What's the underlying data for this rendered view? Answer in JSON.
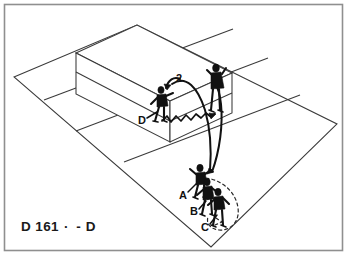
{
  "diagram": {
    "title": "D 161",
    "caption": {
      "code": "D 161",
      "separator": "· -",
      "tail": "D"
    },
    "kind": "volleyball-court-perspective-drill",
    "background_color": "#ffffff",
    "ink_color": "#111111",
    "frame_color": "#8f8f8f",
    "court_line_color": "#3a3a3a"
  },
  "labels": {
    "player_a": "A",
    "player_b": "B",
    "player_c": "C",
    "player_d": "D",
    "sequence_2": "2"
  },
  "players": [
    {
      "id": "player-a",
      "label": "A",
      "role": "setter-front",
      "x": 200,
      "y": 174
    },
    {
      "id": "player-b",
      "label": "B",
      "role": "receiver-middle",
      "x": 203,
      "y": 192
    },
    {
      "id": "player-c",
      "label": "C",
      "role": "receiver-back",
      "x": 215,
      "y": 204
    },
    {
      "id": "player-d",
      "label": "D",
      "role": "opponent-far-left",
      "x": 160,
      "y": 105
    },
    {
      "id": "player-net",
      "label": "",
      "role": "blocker-at-net",
      "x": 215,
      "y": 90
    }
  ],
  "annotations": {
    "ball_path_label": "2",
    "ball_path_label_x": 178,
    "ball_path_label_y": 80,
    "label_a_x": 184,
    "label_a_y": 196,
    "label_b_x": 195,
    "label_b_y": 212,
    "label_c_x": 206,
    "label_c_y": 228,
    "label_d_x": 142,
    "label_d_y": 121
  },
  "geometry": {
    "court_corners": {
      "left": [
        14,
        77
      ],
      "top": [
        137,
        25
      ],
      "right": [
        337,
        124
      ],
      "bottom": [
        211,
        247
      ]
    },
    "net_top_front_left": [
      76,
      53
    ],
    "net_top_front_right": [
      232,
      116
    ],
    "net_height_px": 42
  }
}
